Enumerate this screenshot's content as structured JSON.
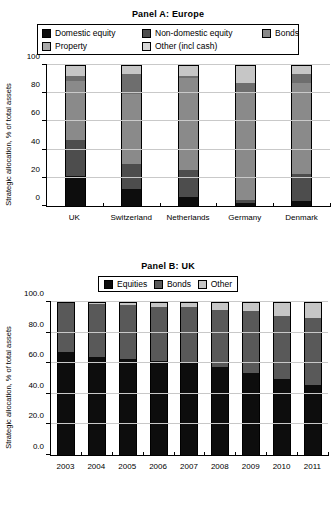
{
  "chart_data": [
    {
      "type": "bar",
      "title": "Panel A:  Europe",
      "subtype": "stacked-vertical-100",
      "xlabel": "",
      "ylabel": "Strategic allocation, % of total assets",
      "ylim": [
        0,
        100
      ],
      "yticks": [
        0,
        20,
        40,
        60,
        80,
        100
      ],
      "ytick_labels": [
        "0",
        "20",
        "40",
        "60",
        "80",
        "100"
      ],
      "grid": true,
      "legend_position": "top",
      "categories": [
        "UK",
        "Switzerland",
        "Netherlands",
        "Germany",
        "Denmark"
      ],
      "series": [
        {
          "name": "Domestic equity",
          "color": "#0d0d0d",
          "values": [
            21.0,
            12.0,
            6.5,
            2.0,
            3.5
          ]
        },
        {
          "name": "Non-domestic equity",
          "color": "#4d4d4d",
          "values": [
            26.0,
            18.0,
            19.0,
            2.5,
            19.0
          ]
        },
        {
          "name": "Bonds",
          "color": "#8a8a8a",
          "values": [
            42.0,
            49.5,
            65.5,
            76.5,
            65.0
          ]
        },
        {
          "name": "Property",
          "color": "#6e6e6e",
          "values": [
            3.0,
            14.0,
            1.5,
            6.0,
            6.5
          ]
        },
        {
          "name": "Other (incl cash)",
          "color": "#c6c6c6",
          "values": [
            8.0,
            6.5,
            7.5,
            13.0,
            6.0
          ]
        }
      ]
    },
    {
      "type": "bar",
      "title": "Panel B:  UK",
      "subtype": "stacked-vertical-100",
      "xlabel": "",
      "ylabel": "Strategic allocation, % of total assets",
      "ylim": [
        0,
        100
      ],
      "yticks": [
        0,
        20,
        40,
        60,
        80,
        100
      ],
      "ytick_labels": [
        "0.0",
        "20.0",
        "40.0",
        "60.0",
        "80.0",
        "100.0"
      ],
      "grid": true,
      "legend_position": "top",
      "categories": [
        "2003",
        "2004",
        "2005",
        "2006",
        "2007",
        "2008",
        "2009",
        "2010",
        "2011"
      ],
      "series": [
        {
          "name": "Equities",
          "color": "#0d0d0d",
          "values": [
            67.5,
            64.0,
            63.0,
            61.5,
            61.0,
            57.5,
            53.5,
            49.5,
            46.0
          ]
        },
        {
          "name": "Bonds",
          "color": "#595959",
          "values": [
            32.5,
            34.5,
            35.0,
            35.0,
            35.5,
            37.5,
            40.5,
            41.5,
            43.5
          ]
        },
        {
          "name": "Other",
          "color": "#c6c6c6",
          "values": [
            0.0,
            1.5,
            2.0,
            3.5,
            3.5,
            5.0,
            6.0,
            9.0,
            10.5
          ]
        }
      ]
    }
  ],
  "panel_a": {
    "title": "Panel A:  Europe",
    "ylabel": "Strategic allocation, % of total assets",
    "legend": [
      {
        "label": "Domestic equity",
        "color": "#0d0d0d"
      },
      {
        "label": "Non-domestic equity",
        "color": "#4d4d4d"
      },
      {
        "label": "Bonds",
        "color": "#8a8a8a"
      },
      {
        "label": "Property",
        "color": "#a8a8a8"
      },
      {
        "label": "Other (incl cash)",
        "color": "#d6d6d6"
      }
    ],
    "ytick_labels": [
      "0",
      "20",
      "40",
      "60",
      "80",
      "100"
    ],
    "xtick_labels": [
      "UK",
      "Switzerland",
      "Netherlands",
      "Germany",
      "Denmark"
    ]
  },
  "panel_b": {
    "title": "Panel B:  UK",
    "ylabel": "Strategic allocation, % of total assets",
    "legend": [
      {
        "label": "Equities",
        "color": "#0d0d0d"
      },
      {
        "label": "Bonds",
        "color": "#595959"
      },
      {
        "label": "Other",
        "color": "#c6c6c6"
      }
    ],
    "ytick_labels": [
      "0.0",
      "20.0",
      "40.0",
      "60.0",
      "80.0",
      "100.0"
    ],
    "xtick_labels": [
      "2003",
      "2004",
      "2005",
      "2006",
      "2007",
      "2008",
      "2009",
      "2010",
      "2011"
    ]
  }
}
